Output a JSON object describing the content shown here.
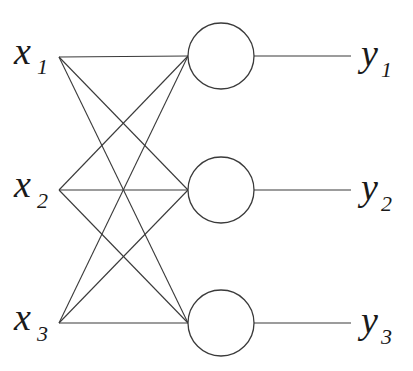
{
  "diagram": {
    "type": "single-layer neural network",
    "inputs": [
      {
        "base": "x",
        "sub": "1",
        "x": 59,
        "y": 57
      },
      {
        "base": "x",
        "sub": "2",
        "x": 59,
        "y": 190
      },
      {
        "base": "x",
        "sub": "3",
        "x": 59,
        "y": 323
      }
    ],
    "nodes": [
      {
        "cx": 221,
        "cy": 56,
        "r": 33
      },
      {
        "cx": 221,
        "cy": 190,
        "r": 33
      },
      {
        "cx": 221,
        "cy": 323,
        "r": 33
      }
    ],
    "outputs": [
      {
        "base": "y",
        "sub": "1",
        "line_end": 351
      },
      {
        "base": "y",
        "sub": "2",
        "line_end": 351
      },
      {
        "base": "y",
        "sub": "3",
        "line_end": 351
      }
    ],
    "colors": {
      "stroke": "#3a3a3a",
      "text": "#1a1a1a",
      "background": "#ffffff"
    }
  }
}
